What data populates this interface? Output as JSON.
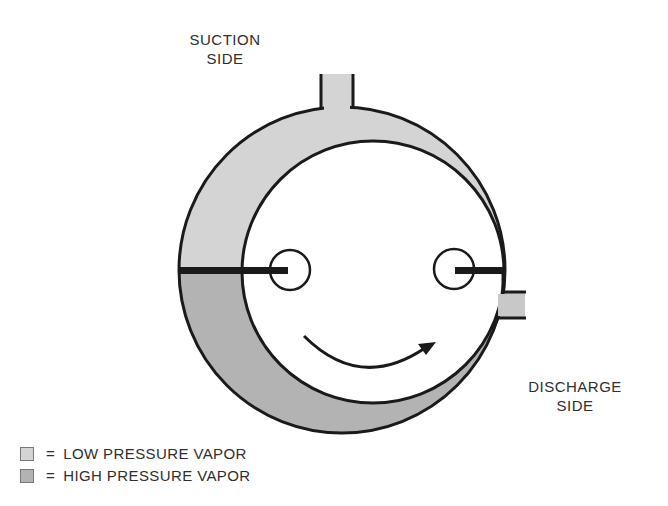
{
  "labels": {
    "suction": [
      "SUCTION",
      "SIDE"
    ],
    "discharge": [
      "DISCHARGE",
      "SIDE"
    ]
  },
  "legend": [
    {
      "symbol": "=",
      "text": "LOW PRESSURE VAPOR",
      "color": "#d4d4d4"
    },
    {
      "symbol": "=",
      "text": "HIGH PRESSURE VAPOR",
      "color": "#b3b3b3"
    }
  ],
  "colors": {
    "low_pressure": "#d4d4d4",
    "high_pressure": "#b3b3b3",
    "outline": "#1a1a1a",
    "background": "#ffffff"
  },
  "diagram": {
    "type": "rotary-vane-compressor",
    "rotation_direction": "counter-clockwise-arrow-left-to-right"
  }
}
